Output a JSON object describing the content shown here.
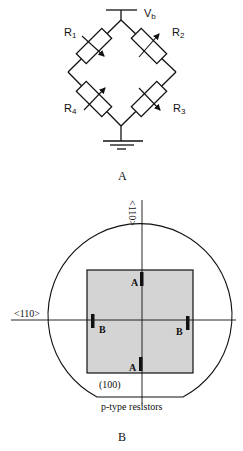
{
  "figure_a": {
    "caption": "A",
    "supply_label": "V",
    "supply_sub": "b",
    "resistors": [
      {
        "label": "R",
        "sub": "1"
      },
      {
        "label": "R",
        "sub": "2"
      },
      {
        "label": "R",
        "sub": "3"
      },
      {
        "label": "R",
        "sub": "4"
      }
    ]
  },
  "figure_b": {
    "caption": "B",
    "vertical_axis_label": "<110>",
    "horizontal_axis_label": "<110>",
    "orientation_label": "(100)",
    "resistor_type_label": "p-type resistors",
    "resistor_labels": {
      "top": "A",
      "bottom": "A",
      "left": "B",
      "right": "B"
    },
    "square_fill": "#d4d4d4"
  }
}
